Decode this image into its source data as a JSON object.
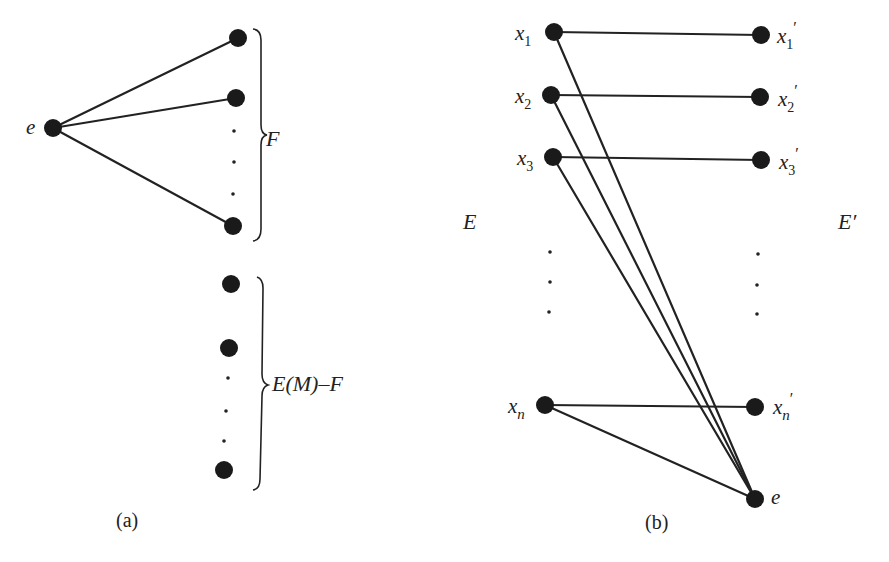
{
  "panel_a": {
    "caption": "(a)",
    "center_node": {
      "label": "e",
      "x": 53,
      "y": 128
    },
    "group_F": {
      "label": "F",
      "nodes": [
        {
          "x": 238,
          "y": 38
        },
        {
          "x": 236,
          "y": 98
        },
        {
          "x": 233,
          "y": 226
        }
      ],
      "ellipsis_dots": [
        {
          "x": 234,
          "y": 131
        },
        {
          "x": 234,
          "y": 162
        },
        {
          "x": 233,
          "y": 194
        }
      ]
    },
    "group_rest": {
      "label_prefix": "E",
      "label_paren": "(M)",
      "label_suffix": "–F",
      "label": "E(M)–F",
      "nodes": [
        {
          "x": 231,
          "y": 284
        },
        {
          "x": 229,
          "y": 348
        },
        {
          "x": 224,
          "y": 470
        }
      ],
      "ellipsis_dots": [
        {
          "x": 228,
          "y": 378
        },
        {
          "x": 226,
          "y": 411
        },
        {
          "x": 224,
          "y": 441
        }
      ]
    }
  },
  "panel_b": {
    "caption": "(b)",
    "left_set_label": "E",
    "right_set_label": "E′",
    "left_nodes": [
      {
        "base": "x",
        "sub": "1",
        "x": 554,
        "y": 32
      },
      {
        "base": "x",
        "sub": "2",
        "x": 551,
        "y": 95
      },
      {
        "base": "x",
        "sub": "3",
        "x": 553,
        "y": 157
      },
      {
        "base": "x",
        "sub": "n",
        "x": 545,
        "y": 405
      }
    ],
    "right_nodes": [
      {
        "base": "x",
        "sub": "1",
        "prime": "′",
        "x": 761,
        "y": 35
      },
      {
        "base": "x",
        "sub": "2",
        "prime": "′",
        "x": 760,
        "y": 97
      },
      {
        "base": "x",
        "sub": "3",
        "prime": "′",
        "x": 761,
        "y": 160
      },
      {
        "base": "x",
        "sub": "n",
        "prime": "′",
        "x": 755,
        "y": 407
      }
    ],
    "bottom_node": {
      "label": "e",
      "x": 755,
      "y": 499
    },
    "left_ellipsis": [
      {
        "x": 550,
        "y": 252
      },
      {
        "x": 550,
        "y": 282
      },
      {
        "x": 549,
        "y": 312
      }
    ],
    "right_ellipsis": [
      {
        "x": 758,
        "y": 254
      },
      {
        "x": 757,
        "y": 285
      },
      {
        "x": 757,
        "y": 314
      }
    ]
  }
}
